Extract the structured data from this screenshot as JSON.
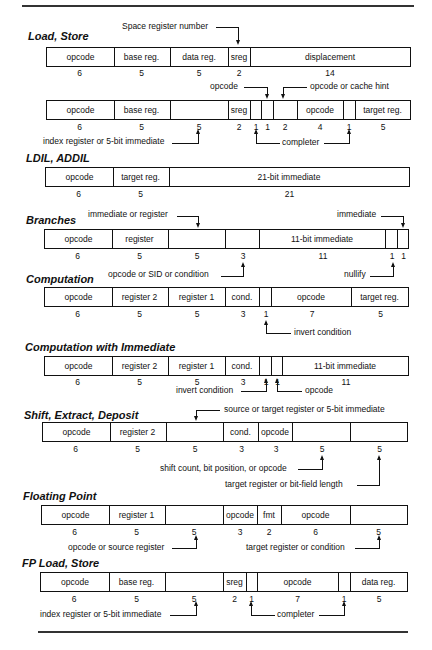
{
  "sections": {
    "load_store": {
      "title": "Load, Store"
    },
    "ldil": {
      "title": "LDIL, ADDIL"
    },
    "branches": {
      "title": "Branches"
    },
    "computation": {
      "title": "Computation"
    },
    "comp_imm": {
      "title": "Computation with Immediate"
    },
    "shift": {
      "title": "Shift, Extract, Deposit"
    },
    "fp": {
      "title": "Floating Point"
    },
    "fp_ls": {
      "title": "FP Load, Store"
    }
  },
  "formats": {
    "ls1": {
      "fields": [
        "opcode",
        "base reg.",
        "data reg.",
        "sreg",
        "displacement"
      ],
      "widths": [
        "6",
        "5",
        "5",
        "2",
        "14"
      ]
    },
    "ls2": {
      "fields": [
        "opcode",
        "base reg.",
        "",
        "sreg",
        "",
        "",
        "",
        "opcode",
        "",
        "target reg."
      ],
      "widths": [
        "6",
        "5",
        "5",
        "2",
        "1",
        "1",
        "2",
        "4",
        "1",
        "5"
      ]
    },
    "ldil": {
      "fields": [
        "opcode",
        "target reg.",
        "21-bit immediate"
      ],
      "widths": [
        "6",
        "5",
        "21"
      ]
    },
    "br": {
      "fields": [
        "opcode",
        "register",
        "",
        "",
        "11-bit immediate",
        "",
        ""
      ],
      "widths": [
        "6",
        "5",
        "5",
        "3",
        "11",
        "1",
        "1"
      ]
    },
    "comp": {
      "fields": [
        "opcode",
        "register 2",
        "register 1",
        "cond.",
        "",
        "opcode",
        "target reg."
      ],
      "widths": [
        "6",
        "5",
        "5",
        "3",
        "1",
        "7",
        "5"
      ]
    },
    "cimm": {
      "fields": [
        "opcode",
        "register 2",
        "register 1",
        "cond.",
        "",
        "",
        "11-bit immediate"
      ],
      "widths": [
        "6",
        "5",
        "5",
        "3",
        "1",
        "1",
        "11"
      ]
    },
    "shift": {
      "fields": [
        "opcode",
        "register 2",
        "",
        "cond.",
        "opcode",
        "",
        ""
      ],
      "widths": [
        "6",
        "5",
        "5",
        "3",
        "3",
        "5",
        "5"
      ]
    },
    "fp": {
      "fields": [
        "opcode",
        "register 1",
        "",
        "opcode",
        "fmt",
        "opcode",
        ""
      ],
      "widths": [
        "6",
        "5",
        "5",
        "3",
        "2",
        "6",
        "5"
      ]
    },
    "fpls": {
      "fields": [
        "opcode",
        "base reg.",
        "",
        "sreg",
        "",
        "opcode",
        "",
        "data reg."
      ],
      "widths": [
        "6",
        "5",
        "5",
        "2",
        "1",
        "7",
        "1",
        "5"
      ]
    }
  },
  "annotations": {
    "space_register_number": "Space register number",
    "opcode": "opcode",
    "opcode_or_cache_hint": "opcode or cache hint",
    "index_register_or_5bit_immediate": "index register or 5-bit immediate",
    "completer": "completer",
    "immediate_or_register": "immediate or register",
    "immediate": "immediate",
    "opcode_or_sid_or_condition": "opcode or SID or condition",
    "nullify": "nullify",
    "invert_condition": "invert condition",
    "invert_condition_2": "invert condition",
    "opcode_2": "opcode",
    "source_or_target": "source or target register or 5-bit immediate",
    "shift_count": "shift count, bit position, or opcode",
    "target_or_bitfield": "target register or bit-field length",
    "opcode_or_source_register": "opcode or source register",
    "target_register_or_condition": "target register or condition",
    "fp_index_register": "index register or 5-bit immediate",
    "fp_completer": "completer"
  }
}
